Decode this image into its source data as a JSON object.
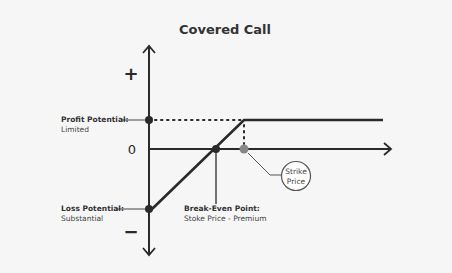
{
  "title": "Covered Call",
  "axis": {
    "plus_sign": "+",
    "minus_sign": "−",
    "zero_label": "0"
  },
  "labels": {
    "profit": {
      "heading": "Profit Potential:",
      "detail": "Limited"
    },
    "loss": {
      "heading": "Loss Potential:",
      "detail": "Substantial"
    },
    "break_even": {
      "heading": "Break-Even Point:",
      "detail": "Stoke Price - Premium"
    },
    "strike": {
      "line1": "Strike",
      "line2": "Price"
    }
  },
  "colors": {
    "line": "#2a2a2a",
    "strike_dot": "#888888",
    "background": "#f6f6f6"
  }
}
